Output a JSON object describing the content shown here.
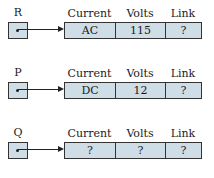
{
  "headers": {
    "current": "Current",
    "volts": "Volts",
    "link": "Link"
  },
  "records": [
    {
      "pointer": "R",
      "current": "AC",
      "volts": "115",
      "link": "?"
    },
    {
      "pointer": "P",
      "current": "DC",
      "volts": "12",
      "link": "?"
    },
    {
      "pointer": "Q",
      "current": "?",
      "volts": "?",
      "link": "?"
    }
  ],
  "colors": {
    "fill": "#cfdde7",
    "stroke": "#333333"
  }
}
